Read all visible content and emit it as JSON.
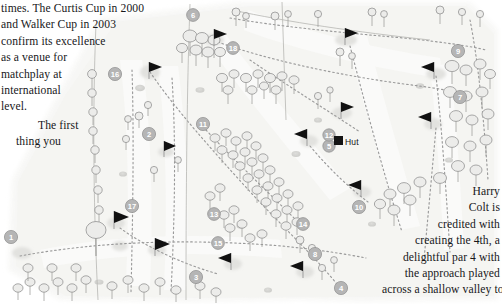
{
  "document": {
    "type": "book-page-with-golf-course-map",
    "page_background": "#ffffff"
  },
  "text_left": {
    "lines": [
      "times. The Curtis Cup in 2000",
      "and Walker Cup in 2003",
      "confirm its excellence",
      "as a venue for",
      "matchplay at",
      "international",
      "level."
    ],
    "paragraph2": [
      "The first",
      "thing you"
    ]
  },
  "text_right": {
    "lines": [
      "Harry",
      "Colt is",
      "credited with",
      "creating the 4th, a",
      "delightful par 4 with",
      "the approach played",
      "across a shallow valley to"
    ]
  },
  "map": {
    "title": "golf-course-layout-map",
    "hut_label": "Hut",
    "hut_marker_color": "#141414",
    "flag_color": "#111111",
    "pole_color": "#9a9a9a",
    "fairway_fill": "#f4f4f2",
    "rough_fill": "#ebebe8",
    "path_color": "#8f8f8f",
    "tree_stroke": "#8d8d8d",
    "tree_fill": "#e8e8e6",
    "marker_fill": "#b9b9b9",
    "marker_text_color": "#ffffff",
    "hole_markers": [
      {
        "number": "1",
        "x": 11,
        "y": 237
      },
      {
        "number": "2",
        "x": 149,
        "y": 134
      },
      {
        "number": "3",
        "x": 196,
        "y": 277
      },
      {
        "number": "4",
        "x": 341,
        "y": 288
      },
      {
        "number": "5",
        "x": 329,
        "y": 146
      },
      {
        "number": "6",
        "x": 193,
        "y": 15
      },
      {
        "number": "7",
        "x": 460,
        "y": 97
      },
      {
        "number": "8",
        "x": 315,
        "y": 254
      },
      {
        "number": "9",
        "x": 458,
        "y": 51
      },
      {
        "number": "10",
        "x": 359,
        "y": 207
      },
      {
        "number": "11",
        "x": 203,
        "y": 124
      },
      {
        "number": "12",
        "x": 329,
        "y": 135
      },
      {
        "number": "13",
        "x": 214,
        "y": 214
      },
      {
        "number": "14",
        "x": 303,
        "y": 224
      },
      {
        "number": "15",
        "x": 218,
        "y": 243
      },
      {
        "number": "16",
        "x": 115,
        "y": 74
      },
      {
        "number": "17",
        "x": 132,
        "y": 206
      },
      {
        "number": "18",
        "x": 233,
        "y": 48
      }
    ],
    "green_flags": [
      {
        "x": 149,
        "y": 62
      },
      {
        "x": 214,
        "y": 29
      },
      {
        "x": 345,
        "y": 28
      },
      {
        "x": 341,
        "y": 102
      },
      {
        "x": 307,
        "y": 129
      },
      {
        "x": 361,
        "y": 180
      },
      {
        "x": 434,
        "y": 62
      },
      {
        "x": 431,
        "y": 112
      },
      {
        "x": 155,
        "y": 238
      },
      {
        "x": 114,
        "y": 211
      },
      {
        "x": 231,
        "y": 253
      },
      {
        "x": 303,
        "y": 261
      },
      {
        "x": 164,
        "y": 141
      }
    ]
  }
}
